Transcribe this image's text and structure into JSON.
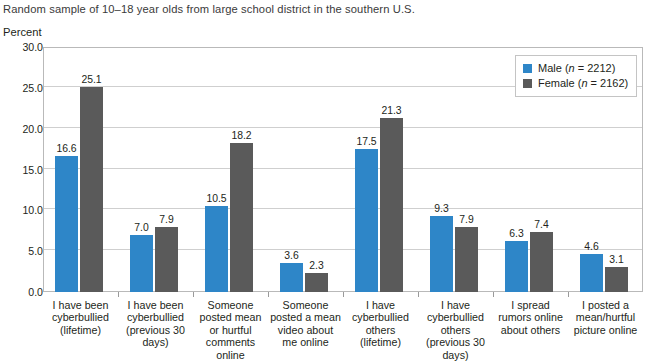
{
  "chart_data": {
    "type": "bar",
    "title": "",
    "subtitle": "Random sample of 10–18 year olds from large school district in the southern U.S.",
    "ylabel": "Percent",
    "xlabel": "",
    "ylim": [
      0,
      30
    ],
    "ytick_labels": [
      "0.0",
      "5.0",
      "10.0",
      "15.0",
      "20.0",
      "25.0",
      "30.0"
    ],
    "ytick_values": [
      0,
      5,
      10,
      15,
      20,
      25,
      30
    ],
    "grid": true,
    "legend_position": "top-right",
    "categories": [
      "I have been cyberbullied (lifetime)",
      "I have been cyberbullied (previous 30 days)",
      "Someone posted mean or hurtful comments online",
      "Someone posted a mean video about me online",
      "I have cyberbullied others (lifetime)",
      "I have cyberbullied others (previous 30 days)",
      "I spread rumors online about others",
      "I posted a mean/hurtful picture online"
    ],
    "category_lines": [
      [
        "I have been",
        "cyberbullied",
        "(lifetime)"
      ],
      [
        "I have been",
        "cyberbullied",
        "(previous 30",
        "days)"
      ],
      [
        "Someone",
        "posted mean",
        "or hurtful",
        "comments",
        "online"
      ],
      [
        "Someone",
        "posted a mean",
        "video about",
        "me online"
      ],
      [
        "I have",
        "cyberbullied",
        "others",
        "(lifetime)"
      ],
      [
        "I have",
        "cyberbullied",
        "others",
        "(previous 30",
        "days)"
      ],
      [
        "I spread",
        "rumors online",
        "about others"
      ],
      [
        "I posted a",
        "mean/hurtful",
        "picture online"
      ]
    ],
    "series": [
      {
        "name": "Male",
        "n": 2212,
        "legend_label": "Male (n = 2212)",
        "color": "#2e86c8",
        "values": [
          16.6,
          7.0,
          10.5,
          3.6,
          17.5,
          9.3,
          6.3,
          4.6
        ],
        "value_labels": [
          "16.6",
          "7.0",
          "10.5",
          "3.6",
          "17.5",
          "9.3",
          "6.3",
          "4.6"
        ]
      },
      {
        "name": "Female",
        "n": 2162,
        "legend_label": "Female (n = 2162)",
        "color": "#5a5a5a",
        "values": [
          25.1,
          7.9,
          18.2,
          2.3,
          21.3,
          7.9,
          7.4,
          3.1
        ],
        "value_labels": [
          "25.1",
          "7.9",
          "18.2",
          "2.3",
          "21.3",
          "7.9",
          "7.4",
          "3.1"
        ]
      }
    ]
  },
  "legend": {
    "male": {
      "name": "Male",
      "n_prefix": "(",
      "n_italic": "n",
      "n_rest": " = 2212)"
    },
    "female": {
      "name": "Female",
      "n_prefix": "(",
      "n_italic": "n",
      "n_rest": " = 2162)"
    }
  },
  "colors": {
    "male_bar": "#2e86c8",
    "female_bar": "#5a5a5a",
    "gridline": "#cfcfcf",
    "frame": "#b9b9b9",
    "text": "#231f20"
  }
}
